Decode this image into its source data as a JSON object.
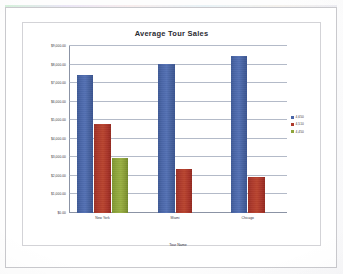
{
  "document": {
    "media": "scanned-printout",
    "page_background": "#ffffff",
    "page_border_color": "#c9c9cd"
  },
  "chart_frame": {
    "border_color": "#d3d3d7",
    "background": "#ffffff"
  },
  "legend": {
    "position": "right",
    "items": [
      {
        "label": "4,650",
        "color": "#4a66a8"
      },
      {
        "label": "4,510",
        "color": "#ae3a2c"
      },
      {
        "label": "4,450",
        "color": "#8fa63c"
      }
    ]
  },
  "chart_data": {
    "type": "bar",
    "title": "Average Tour Sales",
    "xlabel": "Tour Name",
    "ylabel": "",
    "categories": [
      "New York",
      "Miami",
      "Chicago"
    ],
    "series": [
      {
        "name": "4,650",
        "color": "#4a66a8",
        "values": [
          7450,
          8050,
          8450
        ]
      },
      {
        "name": "4,510",
        "color": "#ae3a2c",
        "values": [
          4800,
          2350,
          1950
        ]
      },
      {
        "name": "4,450",
        "color": "#8fa63c",
        "values": [
          2950,
          null,
          null
        ]
      }
    ],
    "ylim": [
      0,
      9000
    ],
    "ytick_step": 1000,
    "ytick_labels": [
      "$0.00",
      "$1,000.00",
      "$2,000.00",
      "$3,000.00",
      "$4,000.00",
      "$5,000.00",
      "$6,000.00",
      "$7,000.00",
      "$8,000.00",
      "$9,000.00"
    ],
    "grid": true,
    "grid_color": "#9aa3b5",
    "legend_position": "right"
  }
}
